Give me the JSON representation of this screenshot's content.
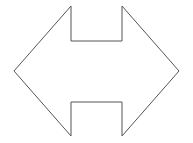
{
  "diagram": {
    "shape": "double-headed-arrow-with-notches",
    "stroke_color": "#555555",
    "fill_color": "#ffffff",
    "stroke_width": 1,
    "points": [
      [
        71,
        6
      ],
      [
        71,
        41
      ],
      [
        122,
        41
      ],
      [
        122,
        6
      ],
      [
        179,
        71
      ],
      [
        122,
        136
      ],
      [
        122,
        102
      ],
      [
        71,
        102
      ],
      [
        71,
        136
      ],
      [
        14,
        71
      ]
    ]
  }
}
